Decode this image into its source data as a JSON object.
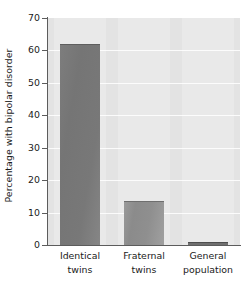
{
  "chart_data": {
    "type": "bar",
    "title": "",
    "xlabel": "",
    "ylabel": "Percentage with bipolar disorder",
    "categories": [
      "Identical twins",
      "Fraternal twins",
      "General population"
    ],
    "category_lines": [
      [
        "Identical",
        "twins"
      ],
      [
        "Fraternal",
        "twins"
      ],
      [
        "General",
        "population"
      ]
    ],
    "values": [
      62,
      13.5,
      1
    ],
    "ylim": [
      0,
      70
    ],
    "yticks": [
      0,
      10,
      20,
      30,
      40,
      50,
      60,
      70
    ],
    "ytick_labels": [
      "0",
      "10",
      "20",
      "30",
      "40",
      "50",
      "60",
      "70"
    ],
    "grid": true,
    "legend": "none",
    "colors": {
      "plot_background": "#e3e3e3",
      "gridline": "#fbfbfb",
      "axis": "#5c5c5c",
      "bar_identical": "#787878",
      "bar_fraternal": "#8f8f8f",
      "bar_general": "#6f6f6f",
      "text": "#1a1a1a",
      "page_background": "#ffffff"
    }
  }
}
